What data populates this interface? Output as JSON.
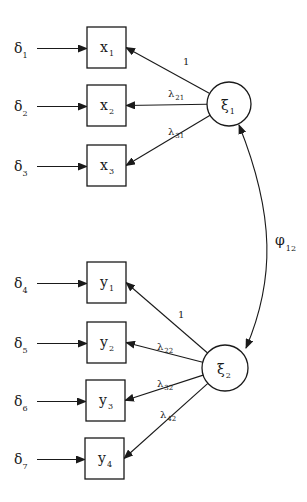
{
  "diagram": {
    "type": "path-diagram",
    "colors": {
      "ink": "#1a1a1a",
      "background": "#ffffff"
    },
    "latents": [
      {
        "id": "xi1",
        "symbol": "ξ",
        "subscript": "1"
      },
      {
        "id": "xi2",
        "symbol": "ξ",
        "subscript": "2"
      }
    ],
    "indicators": [
      {
        "id": "x1",
        "symbol": "x",
        "subscript": "1",
        "error_symbol": "δ",
        "error_subscript": "1",
        "factor": "xi1",
        "loading_symbol": "",
        "loading_subscript": "",
        "loading_text": "1"
      },
      {
        "id": "x2",
        "symbol": "x",
        "subscript": "2",
        "error_symbol": "δ",
        "error_subscript": "2",
        "factor": "xi1",
        "loading_symbol": "λ",
        "loading_subscript": "21",
        "loading_text": ""
      },
      {
        "id": "x3",
        "symbol": "x",
        "subscript": "3",
        "error_symbol": "δ",
        "error_subscript": "3",
        "factor": "xi1",
        "loading_symbol": "λ",
        "loading_subscript": "31",
        "loading_text": ""
      },
      {
        "id": "y1",
        "symbol": "y",
        "subscript": "1",
        "error_symbol": "δ",
        "error_subscript": "4",
        "factor": "xi2",
        "loading_symbol": "",
        "loading_subscript": "",
        "loading_text": "1"
      },
      {
        "id": "y2",
        "symbol": "y",
        "subscript": "2",
        "error_symbol": "δ",
        "error_subscript": "5",
        "factor": "xi2",
        "loading_symbol": "λ",
        "loading_subscript": "22",
        "loading_text": ""
      },
      {
        "id": "y3",
        "symbol": "y",
        "subscript": "3",
        "error_symbol": "δ",
        "error_subscript": "6",
        "factor": "xi2",
        "loading_symbol": "λ",
        "loading_subscript": "32",
        "loading_text": ""
      },
      {
        "id": "y4",
        "symbol": "y",
        "subscript": "4",
        "error_symbol": "δ",
        "error_subscript": "7",
        "factor": "xi2",
        "loading_symbol": "λ",
        "loading_subscript": "42",
        "loading_text": ""
      }
    ],
    "covariance": {
      "from": "xi1",
      "to": "xi2",
      "symbol": "φ",
      "subscript": "12"
    }
  }
}
